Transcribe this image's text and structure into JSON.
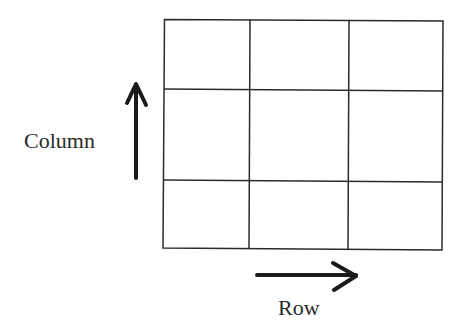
{
  "diagram": {
    "grid": {
      "rows": 3,
      "columns": 3
    },
    "labels": {
      "column": "Column",
      "row": "Row"
    },
    "colors": {
      "line": "#2a2a2a",
      "background": "#ffffff"
    }
  }
}
